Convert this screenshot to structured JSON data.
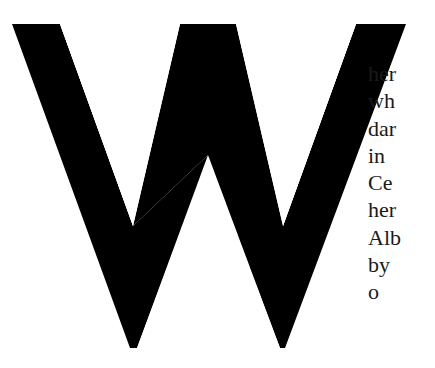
{
  "dropcap": {
    "letter": "W",
    "color": "#000000"
  },
  "body_text": {
    "lines": [
      "her",
      "wh",
      "dar",
      "in",
      "Ce",
      "her",
      "Alb",
      "by",
      "o"
    ]
  }
}
